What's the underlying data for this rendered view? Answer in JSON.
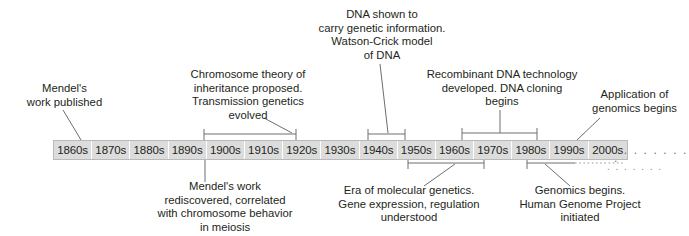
{
  "figure": {
    "bar": {
      "decades": [
        "1860s",
        "1870s",
        "1880s",
        "1890s",
        "1900s",
        "1910s",
        "1920s",
        "1930s",
        "1940s",
        "1950s",
        "1960s",
        "1970s",
        "1980s",
        "1990s",
        "2000s"
      ],
      "continuation_dots": ". . . . . . . . .",
      "continuation_dots_lower": ". . . . . . .",
      "fill_color": "#dcdcdc",
      "border_color": "#b9b9b9",
      "text_color": "#231f20"
    },
    "annotations_above": [
      {
        "id": "mendel-work-published",
        "text": "Mendel's\nwork published",
        "connector": "diagonal-leader"
      },
      {
        "id": "chromosome-theory",
        "text": "Chromosome theory of\ninheritance proposed.\nTransmission genetics\nevolved",
        "connector": "span-bracket-with-diagonal"
      },
      {
        "id": "dna-genetic-information",
        "text": "DNA shown to\ncarry genetic information.\nWatson-Crick model\nof DNA",
        "connector": "span-bracket-with-diagonal"
      },
      {
        "id": "recombinant-dna",
        "text": "Recombinant DNA technology\ndeveloped. DNA cloning\nbegins",
        "connector": "span-bracket-with-stem"
      },
      {
        "id": "application-of-genomics",
        "text": "Application of\ngenomics begins",
        "connector": "diagonal-leader"
      }
    ],
    "annotations_below": [
      {
        "id": "mendel-rediscovered",
        "text": "Mendel's work\nrediscovered, correlated\nwith chromosome behavior\nin meiosis",
        "connector": "vertical-stem"
      },
      {
        "id": "era-of-molecular-genetics",
        "text": "Era of molecular genetics.\nGene expression, regulation\nunderstood",
        "connector": "span-bracket-with-diagonal"
      },
      {
        "id": "genomics-begins",
        "text": "Genomics begins.\nHuman Genome Project\ninitiated",
        "connector": "span-bracket-dotted-with-diagonal"
      }
    ],
    "line_color": "#6d6e70"
  }
}
